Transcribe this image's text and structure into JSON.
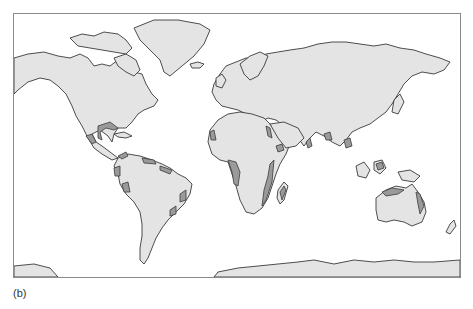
{
  "figure": {
    "panel_label": "(b)",
    "type": "world map",
    "projection": "equirectangular-like",
    "colors": {
      "land": "#e4e4e4",
      "coastline": "#3a3a3a",
      "highlighted_zone": "#9a9a9a",
      "ocean": "#ffffff",
      "frame": "#8a8a8a"
    },
    "highlighted_regions": [
      "Gulf of Mexico coast",
      "Pacific coast of Mexico / Central America",
      "Caribbean coast of Central America",
      "Northern South America coast",
      "Western coast of South America (Ecuador/Colombia)",
      "Eastern coast of Brazil",
      "West African coast",
      "Gulf of Guinea / Central-West Africa coast",
      "East African coast",
      "Red Sea coast",
      "Madagascar",
      "South and Southeast Asian coasts",
      "Northern and eastern Australian coast"
    ],
    "continents": [
      "North America",
      "Greenland",
      "South America",
      "Europe",
      "Africa",
      "Asia",
      "Australia",
      "Antarctica"
    ]
  }
}
